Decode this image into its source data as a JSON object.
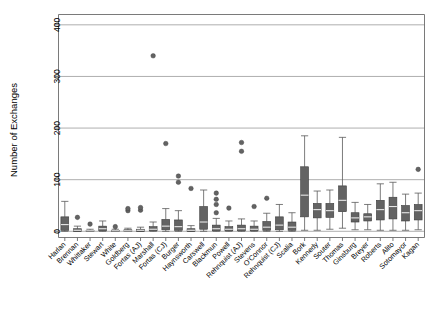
{
  "chart_data": {
    "type": "box",
    "title": "",
    "subtitle": "",
    "xlabel": "",
    "ylabel": "Number of Exchanges",
    "ylim": [
      -12,
      420
    ],
    "yticks": [
      0,
      100,
      200,
      300,
      400
    ],
    "ytick_labels": [
      "0",
      "100",
      "200",
      "300",
      "400"
    ],
    "grid": "horizontal",
    "legend": "none",
    "categories": [
      "Harlan",
      "Brennan",
      "Whittaker",
      "Stewart",
      "White",
      "Goldberg",
      "Fortas (AJ)",
      "Marshall",
      "Fortas (CJ)",
      "Burger",
      "Haynsworth",
      "Carswell",
      "Blackmun",
      "Powell",
      "Rehnquist (AJ)",
      "Stevens",
      "O'Connor",
      "Rehnquist (CJ)",
      "Scalia",
      "Bork",
      "Kennedy",
      "Souter",
      "Thomas",
      "Ginsburg",
      "Breyer",
      "Roberts",
      "Alito",
      "Sotomayor",
      "Kagan"
    ],
    "boxes": [
      {
        "category": "Harlan",
        "whisker_low": 0,
        "q1": 2,
        "median": 13,
        "q3": 28,
        "whisker_high": 58,
        "outliers": []
      },
      {
        "category": "Brennan",
        "whisker_low": 0,
        "q1": 0,
        "median": 2,
        "q3": 5,
        "whisker_high": 10,
        "outliers": [
          27
        ]
      },
      {
        "category": "Whittaker",
        "whisker_low": 0,
        "q1": 0,
        "median": 1,
        "q3": 2,
        "whisker_high": 4,
        "outliers": [
          14
        ]
      },
      {
        "category": "Stewart",
        "whisker_low": 0,
        "q1": 1,
        "median": 5,
        "q3": 10,
        "whisker_high": 20,
        "outliers": []
      },
      {
        "category": "White",
        "whisker_low": 0,
        "q1": 0,
        "median": 1,
        "q3": 2,
        "whisker_high": 4,
        "outliers": [
          9
        ]
      },
      {
        "category": "Goldberg",
        "whisker_low": 0,
        "q1": 0,
        "median": 1,
        "q3": 3,
        "whisker_high": 6,
        "outliers": [
          40,
          44
        ]
      },
      {
        "category": "Fortas (AJ)",
        "whisker_low": 0,
        "q1": 0,
        "median": 2,
        "q3": 4,
        "whisker_high": 8,
        "outliers": [
          41,
          46
        ]
      },
      {
        "category": "Marshall",
        "whisker_low": 0,
        "q1": 1,
        "median": 4,
        "q3": 9,
        "whisker_high": 18,
        "outliers": [
          340
        ]
      },
      {
        "category": "Fortas (CJ)",
        "whisker_low": 0,
        "q1": 3,
        "median": 10,
        "q3": 23,
        "whisker_high": 44,
        "outliers": [
          170
        ]
      },
      {
        "category": "Burger",
        "whisker_low": 0,
        "q1": 2,
        "median": 9,
        "q3": 22,
        "whisker_high": 40,
        "outliers": [
          95,
          107
        ]
      },
      {
        "category": "Haynsworth",
        "whisker_low": 0,
        "q1": 0,
        "median": 2,
        "q3": 5,
        "whisker_high": 11,
        "outliers": [
          83
        ]
      },
      {
        "category": "Carswell",
        "whisker_low": 0,
        "q1": 4,
        "median": 18,
        "q3": 48,
        "whisker_high": 80,
        "outliers": []
      },
      {
        "category": "Blackmun",
        "whisker_low": 0,
        "q1": 1,
        "median": 5,
        "q3": 12,
        "whisker_high": 25,
        "outliers": [
          36,
          52,
          62,
          74
        ]
      },
      {
        "category": "Powell",
        "whisker_low": 0,
        "q1": 1,
        "median": 4,
        "q3": 9,
        "whisker_high": 20,
        "outliers": [
          45
        ]
      },
      {
        "category": "Rehnquist (AJ)",
        "whisker_low": 0,
        "q1": 1,
        "median": 5,
        "q3": 12,
        "whisker_high": 24,
        "outliers": [
          155,
          172
        ]
      },
      {
        "category": "Stevens",
        "whisker_low": 0,
        "q1": 1,
        "median": 4,
        "q3": 10,
        "whisker_high": 20,
        "outliers": [
          48
        ]
      },
      {
        "category": "O'Connor",
        "whisker_low": 0,
        "q1": 2,
        "median": 8,
        "q3": 19,
        "whisker_high": 35,
        "outliers": [
          64
        ]
      },
      {
        "category": "Rehnquist (CJ)",
        "whisker_low": 0,
        "q1": 3,
        "median": 12,
        "q3": 28,
        "whisker_high": 52,
        "outliers": []
      },
      {
        "category": "Scalia",
        "whisker_low": 0,
        "q1": 2,
        "median": 8,
        "q3": 18,
        "whisker_high": 36,
        "outliers": []
      },
      {
        "category": "Bork",
        "whisker_low": 2,
        "q1": 28,
        "median": 70,
        "q3": 125,
        "whisker_high": 185,
        "outliers": []
      },
      {
        "category": "Kennedy",
        "whisker_low": 2,
        "q1": 26,
        "median": 42,
        "q3": 54,
        "whisker_high": 78,
        "outliers": []
      },
      {
        "category": "Souter",
        "whisker_low": 4,
        "q1": 27,
        "median": 40,
        "q3": 54,
        "whisker_high": 80,
        "outliers": []
      },
      {
        "category": "Thomas",
        "whisker_low": 6,
        "q1": 38,
        "median": 60,
        "q3": 88,
        "whisker_high": 182,
        "outliers": []
      },
      {
        "category": "Ginsburg",
        "whisker_low": 3,
        "q1": 18,
        "median": 26,
        "q3": 36,
        "whisker_high": 56,
        "outliers": []
      },
      {
        "category": "Breyer",
        "whisker_low": 3,
        "q1": 20,
        "median": 28,
        "q3": 34,
        "whisker_high": 52,
        "outliers": []
      },
      {
        "category": "Roberts",
        "whisker_low": 2,
        "q1": 22,
        "median": 42,
        "q3": 60,
        "whisker_high": 92,
        "outliers": []
      },
      {
        "category": "Alito",
        "whisker_low": 2,
        "q1": 24,
        "median": 48,
        "q3": 66,
        "whisker_high": 95,
        "outliers": []
      },
      {
        "category": "Sotomayor",
        "whisker_low": 2,
        "q1": 20,
        "median": 36,
        "q3": 50,
        "whisker_high": 72,
        "outliers": []
      },
      {
        "category": "Kagan",
        "whisker_low": 3,
        "q1": 22,
        "median": 40,
        "q3": 52,
        "whisker_high": 74,
        "outliers": [
          120
        ]
      }
    ],
    "colors": {
      "box_fill": "#636363",
      "box_edge": "#3b3b3b",
      "median": "#e8e8e8",
      "whisker": "#5a5a5a",
      "outlier": "#636363",
      "grid": "#9a9a9a",
      "frame": "#8c8c8c",
      "background": "#ffffff"
    }
  }
}
